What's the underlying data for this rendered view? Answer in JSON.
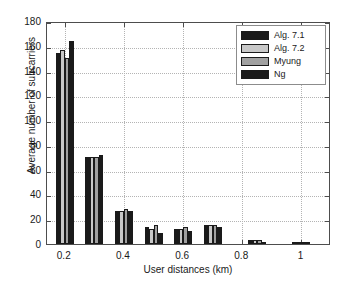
{
  "chart_data": {
    "type": "bar",
    "title": "",
    "xlabel": "User distances (km)",
    "ylabel": "Average number of subcarriers",
    "xlim": [
      0.14,
      1.1
    ],
    "ylim": [
      0,
      180
    ],
    "ytick_labels": [
      "0",
      "20",
      "40",
      "60",
      "80",
      "100",
      "120",
      "140",
      "160",
      "180"
    ],
    "ytick_values": [
      0,
      20,
      40,
      60,
      80,
      100,
      120,
      140,
      160,
      180
    ],
    "xtick_labels": [
      "0.2",
      "0.4",
      "0.6",
      "0.8",
      "1"
    ],
    "xtick_values": [
      0.2,
      0.4,
      0.6,
      0.8,
      1.0
    ],
    "grid": true,
    "legend_position": "top-right",
    "categories": [
      0.2,
      0.3,
      0.4,
      0.5,
      0.6,
      0.7,
      0.85,
      1.0
    ],
    "series": [
      {
        "name": "Alg. 7.1",
        "color": "#1a1a1a",
        "values": [
          154,
          70,
          27,
          14,
          12,
          15,
          3,
          2
        ]
      },
      {
        "name": "Alg. 7.2",
        "color": "#c8c8c8",
        "values": [
          157,
          70,
          27,
          12.5,
          12,
          15,
          3.5,
          2
        ]
      },
      {
        "name": "Myung",
        "color": "#a0a0a0",
        "values": [
          150,
          70,
          28,
          15,
          14,
          15,
          3,
          2
        ]
      },
      {
        "name": "Ng",
        "color": "#1a1a1a",
        "values": [
          164,
          72,
          27,
          9,
          10.5,
          14,
          1.5,
          1.5
        ]
      }
    ]
  },
  "legend": {
    "items": [
      {
        "label": "Alg. 7.1",
        "color": "#1a1a1a"
      },
      {
        "label": "Alg. 7.2",
        "color": "#c8c8c8"
      },
      {
        "label": "Myung",
        "color": "#a0a0a0"
      },
      {
        "label": "Ng",
        "color": "#1a1a1a"
      }
    ]
  }
}
